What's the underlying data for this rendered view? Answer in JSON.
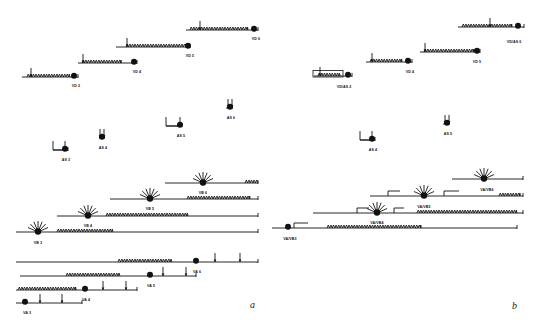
{
  "figure": {
    "background_color": "#ffffff",
    "ink_color": "#111111",
    "width": 535,
    "height": 329
  },
  "panels": [
    {
      "id": "a",
      "letter": "a",
      "letter_x": 250,
      "letter_y": 299
    },
    {
      "id": "b",
      "letter": "b",
      "letter_x": 512,
      "letter_y": 300
    }
  ],
  "chart_data": {
    "type": "diagram",
    "glyph_legend": [
      {
        "name": "baseline",
        "meaning": "horizontal linear map axis"
      },
      {
        "name": "sawtooth",
        "meaning": "tandem repeat array block"
      },
      {
        "name": "filled-circle",
        "meaning": "breakpoint / junction marker"
      },
      {
        "name": "up-arrow",
        "meaning": "single insertion or probe site"
      },
      {
        "name": "fan-arrows",
        "meaning": "multiple radiating insertion sites"
      },
      {
        "name": "bracket",
        "meaning": "flanking bracket / step offset"
      }
    ],
    "panel_a": {
      "groups": [
        {
          "group": "VD",
          "constructs": [
            {
              "label": "VD 2",
              "x1": 22,
              "x2": 78,
              "y": 77,
              "saw_x1": 27,
              "saw_x2": 70,
              "circle_x": 74,
              "arrows": [
                31
              ],
              "label_x": 76,
              "label_y": 84
            },
            {
              "label": "VD 4",
              "x1": 78,
              "x2": 137,
              "y": 63,
              "saw_x1": 82,
              "saw_x2": 121,
              "circle_x": 134,
              "arrows": [
                83
              ],
              "label_x": 137,
              "label_y": 70
            },
            {
              "label": "VD 5",
              "x1": 116,
              "x2": 190,
              "y": 47,
              "saw_x1": 126,
              "saw_x2": 186,
              "circle_x": 188,
              "arrows": [
                127
              ],
              "label_x": 190,
              "label_y": 54
            },
            {
              "label": "VD 6",
              "x1": 186,
              "x2": 258,
              "y": 30,
              "saw_x1": 190,
              "saw_x2": 248,
              "circle_x": 254,
              "arrows": [
                200
              ],
              "label_x": 256,
              "label_y": 37
            }
          ]
        },
        {
          "group": "AS",
          "constructs": [
            {
              "label": "AS 3",
              "x1": 53,
              "x2": 68,
              "y": 150,
              "circle_x": 65,
              "arrows": [
                65
              ],
              "bracket": true,
              "label_x": 66,
              "label_y": 158
            },
            {
              "label": "AS 4",
              "x1": 99,
              "x2": 104,
              "y": 138,
              "circle_x": 102,
              "arrows": [
                100,
                104
              ],
              "bracket": false,
              "label_x": 103,
              "label_y": 146
            },
            {
              "label": "AS 5",
              "x1": 166,
              "x2": 182,
              "y": 126,
              "circle_x": 180,
              "arrows": [
                180
              ],
              "bracket": true,
              "label_x": 181,
              "label_y": 134
            },
            {
              "label": "AS 6",
              "x1": 226,
              "x2": 232,
              "y": 108,
              "circle_x": 230,
              "arrows": [
                228,
                232
              ],
              "bracket": false,
              "label_x": 231,
              "label_y": 116
            }
          ]
        },
        {
          "group": "VB",
          "constructs": [
            {
              "label": "VB 3",
              "x1": 16,
              "x2": 258,
              "y": 232,
              "saw_x1": 57,
              "saw_x2": 113,
              "fan_x": 38,
              "label_x": 38,
              "label_y": 241
            },
            {
              "label": "VB 4",
              "x1": 57,
              "x2": 258,
              "y": 216,
              "saw_x1": 106,
              "saw_x2": 188,
              "fan_x": 88,
              "label_x": 88,
              "label_y": 224
            },
            {
              "label": "VB 5",
              "x1": 110,
              "x2": 258,
              "y": 199,
              "saw_x1": 187,
              "saw_x2": 250,
              "fan_x": 150,
              "label_x": 150,
              "label_y": 207
            },
            {
              "label": "VB 6",
              "x1": 165,
              "x2": 258,
              "y": 183,
              "saw_x1": 245,
              "saw_x2": 258,
              "fan_x": 203,
              "label_x": 203,
              "label_y": 191
            }
          ]
        },
        {
          "group": "VA",
          "constructs": [
            {
              "label": "VA 3",
              "x1": 16,
              "x2": 82,
              "y": 303,
              "circle_x": 25,
              "arrows": [
                40,
                62
              ],
              "label_x": 27,
              "label_y": 311
            },
            {
              "label": "VA 4",
              "x1": 16,
              "x2": 137,
              "y": 290,
              "saw_x1": 18,
              "saw_x2": 76,
              "circle_x": 85,
              "arrows": [
                103,
                126
              ],
              "label_x": 86,
              "label_y": 298
            },
            {
              "label": "VA 5",
              "x1": 20,
              "x2": 196,
              "y": 276,
              "saw_x1": 66,
              "saw_x2": 120,
              "circle_x": 150,
              "arrows": [
                163,
                186
              ],
              "label_x": 151,
              "label_y": 284
            },
            {
              "label": "VA 6",
              "x1": 16,
              "x2": 258,
              "y": 262,
              "saw_x1": 118,
              "saw_x2": 172,
              "circle_x": 196,
              "arrows": [
                215,
                240
              ],
              "label_x": 197,
              "label_y": 270
            }
          ]
        }
      ]
    },
    "panel_b": {
      "groups": [
        {
          "group": "VD/AS",
          "constructs": [
            {
              "label": "VD/AS 2",
              "x1": 314,
              "x2": 352,
              "y": 76,
              "saw_x1": 318,
              "saw_x2": 340,
              "circle_x": 348,
              "arrows": [
                320
              ],
              "boxed": true,
              "label_x": 344,
              "label_y": 85
            },
            {
              "label": "VD 4",
              "x1": 366,
              "x2": 412,
              "y": 62,
              "saw_x1": 370,
              "saw_x2": 402,
              "circle_x": 408,
              "arrows": [
                372
              ],
              "label_x": 410,
              "label_y": 70
            },
            {
              "label": "VD 5",
              "x1": 420,
              "x2": 480,
              "y": 52,
              "saw_x1": 424,
              "saw_x2": 474,
              "circle_x": 477,
              "arrows": [
                425
              ],
              "label_x": 477,
              "label_y": 60
            },
            {
              "label": "VD/AS 6",
              "x1": 458,
              "x2": 524,
              "y": 27,
              "saw_x1": 462,
              "saw_x2": 512,
              "circle_x": 518,
              "arrows": [
                490
              ],
              "label_x": 514,
              "label_y": 40
            }
          ]
        },
        {
          "group": "AS",
          "constructs": [
            {
              "label": "AS 4",
              "x1": 360,
              "x2": 375,
              "y": 140,
              "circle_x": 372,
              "arrows": [
                372
              ],
              "bracket": true,
              "label_x": 373,
              "label_y": 148
            },
            {
              "label": "AS 5",
              "x1": 443,
              "x2": 449,
              "y": 124,
              "circle_x": 447,
              "arrows": [
                445,
                449
              ],
              "bracket": false,
              "label_x": 448,
              "label_y": 132
            }
          ]
        },
        {
          "group": "VA/VB",
          "constructs": [
            {
              "label": "VA/VB3",
              "x1": 272,
              "x2": 517,
              "y": 228,
              "saw_x1": 327,
              "saw_x2": 421,
              "circle_x": 288,
              "step_x1": 294,
              "step_x2": 308,
              "label_x": 290,
              "label_y": 237
            },
            {
              "label": "VA/VB4",
              "x1": 313,
              "x2": 523,
              "y": 213,
              "saw_x1": 417,
              "saw_x2": 517,
              "fan_x": 377,
              "step_x1": 357,
              "step_x2": 369,
              "step2_x1": 394,
              "step2_x2": 404,
              "label_x": 377,
              "label_y": 221
            },
            {
              "label": "VA/VB5",
              "x1": 370,
              "x2": 523,
              "y": 196,
              "saw_x1": 499,
              "saw_x2": 520,
              "fan_x": 424,
              "step_x1": 388,
              "step_x2": 400,
              "step2_x1": 444,
              "step2_x2": 459,
              "label_x": 424,
              "label_y": 205
            },
            {
              "label": "VA/VB6",
              "x1": 452,
              "x2": 523,
              "y": 179,
              "fan_x": 484,
              "label_x": 487,
              "label_y": 188
            }
          ]
        }
      ]
    }
  }
}
